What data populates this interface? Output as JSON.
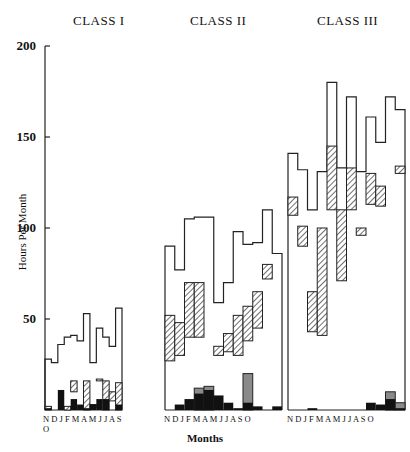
{
  "chart_data": {
    "type": "bar",
    "subtype": "stacked step histogram, three panels",
    "ylabel": "Hours Per Month",
    "xlabel": "Months",
    "ylim": [
      0,
      200
    ],
    "yticks": [
      50,
      100,
      150,
      200
    ],
    "categories": [
      "N",
      "D",
      "J",
      "F",
      "M",
      "A",
      "M",
      "J",
      "J",
      "A",
      "S",
      "O"
    ],
    "legend": [],
    "panels": [
      {
        "title": "CLASS I",
        "series": [
          {
            "name": "total (outline)",
            "values": [
              28,
              26,
              36,
              40,
              41,
              38,
              53,
              26,
              45,
              40,
              35,
              56
            ]
          },
          {
            "name": "hatched top",
            "values": [
              2,
              0,
              0,
              2,
              16,
              0,
              16,
              3,
              17,
              16,
              10,
              15
            ]
          },
          {
            "name": "hatched bottom",
            "values": [
              0,
              0,
              0,
              0,
              10,
              0,
              0,
              1,
              16,
              0,
              5,
              0
            ]
          },
          {
            "name": "black",
            "values": [
              1,
              0,
              11,
              0,
              6,
              3,
              1,
              3,
              6,
              6,
              0,
              3
            ]
          }
        ]
      },
      {
        "title": "CLASS II",
        "series": [
          {
            "name": "total (outline)",
            "values": [
              90,
              77,
              105,
              106,
              106,
              59,
              70,
              98,
              91,
              92,
              110,
              86
            ]
          },
          {
            "name": "hatched top",
            "values": [
              52,
              48,
              70,
              70,
              0,
              35,
              42,
              52,
              57,
              65,
              80,
              0
            ]
          },
          {
            "name": "hatched bottom",
            "values": [
              27,
              30,
              40,
              40,
              0,
              30,
              32,
              30,
              38,
              45,
              72,
              0
            ]
          },
          {
            "name": "gray",
            "values": [
              0,
              0,
              0,
              12,
              13,
              0,
              0,
              0,
              20,
              0,
              0,
              0
            ]
          },
          {
            "name": "black",
            "values": [
              0,
              3,
              6,
              9,
              11,
              8,
              4,
              1,
              4,
              2,
              0,
              2
            ]
          }
        ]
      },
      {
        "title": "CLASS III",
        "series": [
          {
            "name": "total (outline)",
            "values": [
              141,
              132,
              110,
              131,
              180,
              133,
              172,
              131,
              161,
              147,
              172,
              165
            ]
          },
          {
            "name": "hatched top",
            "values": [
              117,
              101,
              65,
              100,
              145,
              110,
              133,
              100,
              130,
              123,
              150,
              134
            ]
          },
          {
            "name": "hatched bottom",
            "values": [
              107,
              90,
              43,
              41,
              110,
              71,
              110,
              96,
              113,
              112,
              153,
              130
            ]
          },
          {
            "name": "gray",
            "values": [
              0,
              0,
              0,
              0,
              0,
              0,
              0,
              0,
              0,
              0,
              10,
              4
            ]
          },
          {
            "name": "black",
            "values": [
              0,
              0,
              1,
              0,
              0,
              0,
              0,
              0,
              4,
              3,
              6,
              1
            ]
          }
        ]
      }
    ]
  },
  "panels": [
    {
      "title": "CLASS I"
    },
    {
      "title": "CLASS II"
    },
    {
      "title": "CLASS III"
    }
  ],
  "axis": {
    "ylabel": "Hours Per Month",
    "xlabel": "Months",
    "ticks": [
      "200",
      "150",
      "100",
      "50"
    ]
  },
  "months_label": "N D J F M A M J J A S O"
}
